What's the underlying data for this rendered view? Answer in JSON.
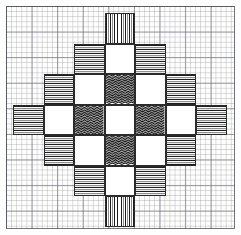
{
  "artwork": {
    "title": "Hand-drawn weaving draft on graph paper",
    "medium": "pencil and ink on graph paper",
    "background_color": "#fdfdfc",
    "grid_line_color": "#5a5f69",
    "ink_color": "#1d1d1d",
    "motif": "diamond cross block pattern"
  },
  "paper": {
    "margin_px": 6,
    "border_color": "#464b55",
    "minor_cell_px": 5.12,
    "major_cell_px": 25.6,
    "minor_per_major": 5
  },
  "chart_data": {
    "type": "heatmap",
    "xlabel": "",
    "ylabel": "",
    "grid": true,
    "legend_position": "none",
    "columns": 7,
    "rows": 7,
    "origin_x": 13,
    "origin_y": 13,
    "cell_width": 30.5,
    "cell_height": 30.5,
    "fill_legend": {
      "none": "blank graph paper (no block drawn)",
      "empty": "drawn block left white / unfilled",
      "vert": "vertical hatching",
      "horiz": "horizontal hatching",
      "wavy": "wavy zigzag hatching"
    },
    "categories": [
      "c1",
      "c2",
      "c3",
      "c4",
      "c5",
      "c6",
      "c7"
    ],
    "row_labels": [
      "r1",
      "r2",
      "r3",
      "r4",
      "r5",
      "r6",
      "r7"
    ],
    "values": [
      [
        "none",
        "none",
        "none",
        "vert",
        "none",
        "none",
        "none"
      ],
      [
        "none",
        "none",
        "horiz",
        "empty",
        "horiz",
        "none",
        "none"
      ],
      [
        "none",
        "horiz",
        "empty",
        "wavy",
        "empty",
        "horiz",
        "none"
      ],
      [
        "horiz",
        "empty",
        "wavy",
        "empty",
        "wavy",
        "empty",
        "horiz"
      ],
      [
        "none",
        "horiz",
        "empty",
        "wavy",
        "empty",
        "horiz",
        "none"
      ],
      [
        "none",
        "none",
        "horiz",
        "empty",
        "horiz",
        "none",
        "none"
      ],
      [
        "none",
        "none",
        "none",
        "vert",
        "none",
        "none",
        "none"
      ]
    ],
    "vertical_hatch_overrides": [
      {
        "row": 2,
        "col": 2,
        "note": "upper-left shoulder block drawn with vertical bars"
      },
      {
        "row": 2,
        "col": 4,
        "note": "upper-right shoulder block drawn with vertical bars"
      },
      {
        "row": 3,
        "col": 1,
        "note": "left shoulder block drawn with vertical bars"
      },
      {
        "row": 3,
        "col": 5,
        "note": "right shoulder block drawn with vertical bars"
      },
      {
        "row": 5,
        "col": 1,
        "note": "left lower shoulder block drawn with vertical bars"
      },
      {
        "row": 5,
        "col": 5,
        "note": "right lower shoulder block drawn with vertical bars"
      },
      {
        "row": 6,
        "col": 2,
        "note": "lower-left shoulder block drawn with vertical bars"
      },
      {
        "row": 6,
        "col": 4,
        "note": "lower-right shoulder block drawn with vertical bars"
      }
    ],
    "filled_block_count": 24,
    "empty_block_count": 9,
    "arm_count": 4,
    "symmetry": "4-fold rotational and mirror symmetric"
  }
}
